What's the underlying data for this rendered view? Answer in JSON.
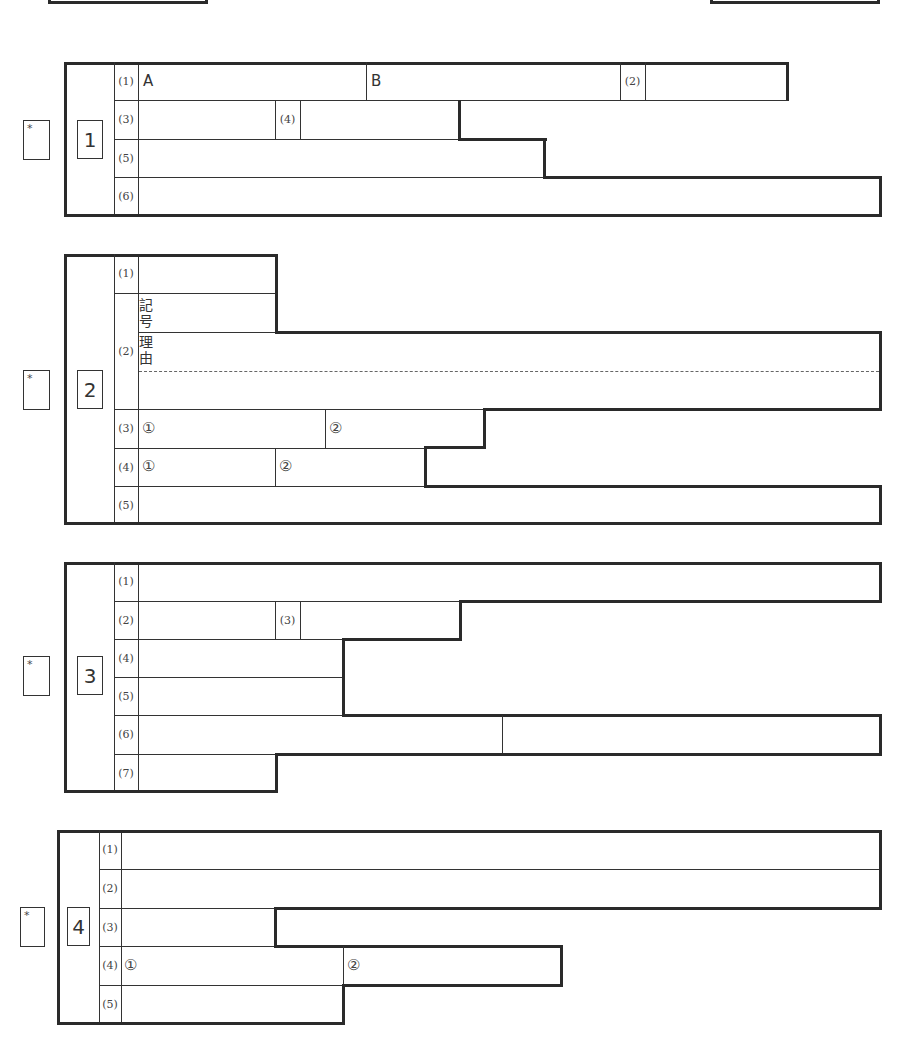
{
  "score_marker": "*",
  "sections": [
    {
      "number": "1",
      "rows": [
        {
          "label": "(1)",
          "cells": [
            {
              "prefix": "A"
            },
            {
              "prefix": "B"
            }
          ],
          "sub_label": "(2)"
        },
        {
          "label": "(3)",
          "sub_label": "(4)"
        },
        {
          "label": "(5)"
        },
        {
          "label": "(6)"
        }
      ]
    },
    {
      "number": "2",
      "rows": [
        {
          "label": "(1)"
        },
        {
          "label": "(2)",
          "parts": [
            "記号",
            "理由"
          ]
        },
        {
          "label": "(3)",
          "cells": [
            {
              "prefix": "①"
            },
            {
              "prefix": "②"
            }
          ]
        },
        {
          "label": "(4)",
          "cells": [
            {
              "prefix": "①"
            },
            {
              "prefix": "②"
            }
          ]
        },
        {
          "label": "(5)"
        }
      ]
    },
    {
      "number": "3",
      "rows": [
        {
          "label": "(1)"
        },
        {
          "label": "(2)",
          "sub_label": "(3)"
        },
        {
          "label": "(4)"
        },
        {
          "label": "(5)"
        },
        {
          "label": "(6)"
        },
        {
          "label": "(7)"
        }
      ]
    },
    {
      "number": "4",
      "rows": [
        {
          "label": "(1)"
        },
        {
          "label": "(2)"
        },
        {
          "label": "(3)"
        },
        {
          "label": "(4)",
          "cells": [
            {
              "prefix": "①"
            },
            {
              "prefix": "②"
            }
          ]
        },
        {
          "label": "(5)"
        }
      ]
    }
  ]
}
